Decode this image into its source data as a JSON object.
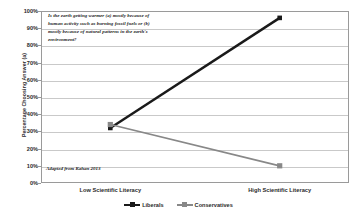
{
  "chart_data": {
    "type": "line",
    "title": "",
    "xlabel": "",
    "ylabel": "Percentage Choosing Answer (a)",
    "categories": [
      "Low Scientific Literacy",
      "High Scientific Literacy"
    ],
    "series": [
      {
        "name": "Liberals",
        "values": [
          32,
          96
        ],
        "color": "#1a1a1a"
      },
      {
        "name": "Conservatives",
        "values": [
          34,
          10
        ],
        "color": "#888888"
      }
    ],
    "ylim": [
      0,
      100
    ],
    "ytick_labels": [
      "0%",
      "10%",
      "20%",
      "30%",
      "40%",
      "50%",
      "60%",
      "70%",
      "80%",
      "90%",
      "100%"
    ],
    "ytick_values": [
      0,
      10,
      20,
      30,
      40,
      50,
      60,
      70,
      80,
      90,
      100
    ],
    "grid": true,
    "legend_position": "bottom",
    "annotations": {
      "question": "Is the earth getting warmer (a) mostly because of human activity such as burning fossil fuels or (b) mostly because of natural patterns in the earth's environment?",
      "source": "Adapted from Kahan 2013"
    }
  },
  "legend": {
    "items": [
      {
        "label": "Liberals"
      },
      {
        "label": "Conservatives"
      }
    ]
  }
}
